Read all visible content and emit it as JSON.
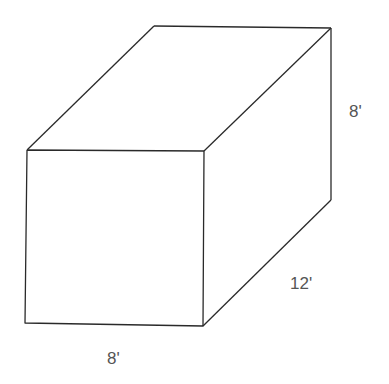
{
  "diagram": {
    "shape": "rectangular prism",
    "colors": {
      "edge": "#2a2a2a",
      "label": "#555555",
      "background": "#ffffff"
    },
    "labels": {
      "height": "8'",
      "depth": "12'",
      "width": "8'"
    }
  }
}
